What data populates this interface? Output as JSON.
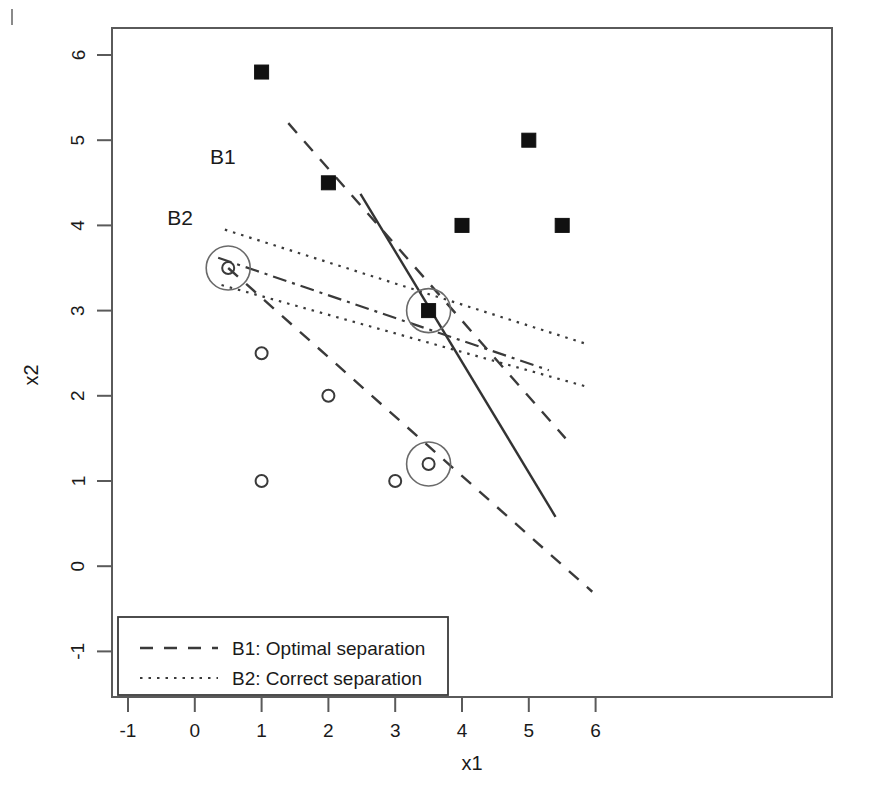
{
  "figure": {
    "background": "#ffffff",
    "corner_tick": "top-left-crop-mark"
  },
  "chart_data": {
    "type": "scatter",
    "title": "",
    "xlabel": "x1",
    "ylabel": "x2",
    "xlim": [
      -1.35,
      6.35
    ],
    "ylim": [
      -1.4,
      6.4
    ],
    "xticks": [
      -1,
      0,
      1,
      2,
      3,
      4,
      5,
      6
    ],
    "xtick_labels": [
      "-1",
      "0",
      "1",
      "2",
      "3",
      "4",
      "5",
      "6"
    ],
    "yticks": [
      -1,
      0,
      1,
      2,
      3,
      4,
      5,
      6
    ],
    "ytick_labels": [
      "-1",
      "0",
      "1",
      "2",
      "3",
      "4",
      "5",
      "6"
    ],
    "grid": false,
    "legend_position": "bottom-left",
    "series": [
      {
        "name": "class-square",
        "marker": "filled-square",
        "points": [
          {
            "x": 1.0,
            "y": 5.8,
            "support": false
          },
          {
            "x": 2.0,
            "y": 4.5,
            "support": false
          },
          {
            "x": 4.0,
            "y": 4.0,
            "support": false
          },
          {
            "x": 5.0,
            "y": 5.0,
            "support": false
          },
          {
            "x": 5.5,
            "y": 4.0,
            "support": false
          },
          {
            "x": 3.5,
            "y": 3.0,
            "support": true
          }
        ]
      },
      {
        "name": "class-circle",
        "marker": "open-circle",
        "points": [
          {
            "x": 1.0,
            "y": 2.5,
            "support": false
          },
          {
            "x": 2.0,
            "y": 2.0,
            "support": false
          },
          {
            "x": 1.0,
            "y": 1.0,
            "support": false
          },
          {
            "x": 3.0,
            "y": 1.0,
            "support": false
          },
          {
            "x": 0.5,
            "y": 3.5,
            "support": true
          },
          {
            "x": 3.5,
            "y": 1.2,
            "support": true
          }
        ]
      }
    ],
    "lines": [
      {
        "name": "B1-decision-boundary",
        "style": "solid",
        "x": [
          2.48,
          5.4
        ],
        "y": [
          4.37,
          0.58
        ]
      },
      {
        "name": "B1-margin-upper",
        "style": "dashed",
        "x": [
          1.4,
          5.55
        ],
        "y": [
          5.2,
          1.5
        ]
      },
      {
        "name": "B1-margin-lower",
        "style": "dashed",
        "x": [
          0.5,
          5.95
        ],
        "y": [
          3.5,
          -0.3
        ]
      },
      {
        "name": "B2-decision-boundary",
        "style": "dashdot",
        "x": [
          0.35,
          5.3
        ],
        "y": [
          3.62,
          2.3
        ]
      },
      {
        "name": "B2-margin-upper",
        "style": "dotted",
        "x": [
          0.45,
          5.9
        ],
        "y": [
          3.95,
          2.6
        ]
      },
      {
        "name": "B2-margin-lower",
        "style": "dotted",
        "x": [
          0.4,
          5.9
        ],
        "y": [
          3.3,
          2.1
        ]
      }
    ],
    "annotations": [
      {
        "text": "B1",
        "x": 0.42,
        "y": 4.72
      },
      {
        "text": "B2",
        "x": -0.22,
        "y": 4.0
      }
    ],
    "support_vector_highlight": {
      "shape": "circle-outline",
      "radius_px": 22,
      "points": [
        {
          "x": 0.5,
          "y": 3.5
        },
        {
          "x": 3.5,
          "y": 3.0
        },
        {
          "x": 3.5,
          "y": 1.2
        }
      ]
    },
    "legend": [
      {
        "label": "B1: Optimal separation",
        "style": "dashed"
      },
      {
        "label": "B2: Correct separation",
        "style": "dotted"
      }
    ]
  }
}
